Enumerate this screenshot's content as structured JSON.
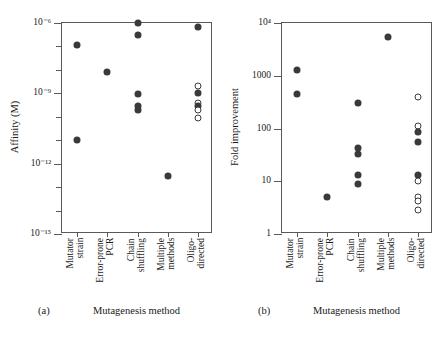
{
  "figure": {
    "panels": [
      {
        "tag": "(a)",
        "xlabel": "Mutagenesis method",
        "ylabel": "Affinity (M)"
      },
      {
        "tag": "(b)",
        "xlabel": "Mutagenesis method",
        "ylabel": "Fold improvement"
      }
    ]
  },
  "categories": [
    "Mutator\nstrain",
    "Error-prone\nPCR",
    "Chain\nshuffling",
    "Multiple\nmethods",
    "Oligo-\ndirected"
  ],
  "yticks_a": [
    {
      "label": "10⁻⁶",
      "exp": -6,
      "major": true
    },
    {
      "label": "",
      "exp": -7,
      "major": false
    },
    {
      "label": "",
      "exp": -8,
      "major": false
    },
    {
      "label": "10⁻⁹",
      "exp": -9,
      "major": true
    },
    {
      "label": "",
      "exp": -10,
      "major": false
    },
    {
      "label": "",
      "exp": -11,
      "major": false
    },
    {
      "label": "10⁻¹²",
      "exp": -12,
      "major": true
    },
    {
      "label": "",
      "exp": -13,
      "major": false
    },
    {
      "label": "",
      "exp": -14,
      "major": false
    },
    {
      "label": "10⁻¹⁵",
      "exp": -15,
      "major": true
    }
  ],
  "yticks_b": [
    {
      "label": "10⁴",
      "exp": 4,
      "major": true
    },
    {
      "label": "1000",
      "exp": 3,
      "major": true
    },
    {
      "label": "100",
      "exp": 2,
      "major": true
    },
    {
      "label": "10",
      "exp": 1,
      "major": true
    },
    {
      "label": "1",
      "exp": 0,
      "major": true
    }
  ],
  "chart_data": [
    {
      "type": "scatter",
      "title": "(a)",
      "xlabel": "Mutagenesis method",
      "ylabel": "Affinity (M)",
      "yscale": "log",
      "ylim": [
        1e-15,
        1e-06
      ],
      "ytick_labels": [
        "10^-6",
        "10^-9",
        "10^-12",
        "10^-15"
      ],
      "ytick_values": [
        1e-06,
        1e-09,
        1e-12,
        1e-15
      ],
      "minor_ticks": true,
      "grid": false,
      "legend": null,
      "categories": [
        "Mutator strain",
        "Error-prone PCR",
        "Chain shuffling",
        "Multiple methods",
        "Oligo-directed"
      ],
      "series": [
        {
          "name": "Reported affinity",
          "points": [
            {
              "category": "Mutator strain",
              "value": 1.2e-07,
              "marker": "filled"
            },
            {
              "category": "Mutator strain",
              "value": 1e-11,
              "marker": "filled"
            },
            {
              "category": "Error-prone PCR",
              "value": 8e-09,
              "marker": "filled"
            },
            {
              "category": "Chain shuffling",
              "value": 1e-06,
              "marker": "filled"
            },
            {
              "category": "Chain shuffling",
              "value": 3e-07,
              "marker": "filled"
            },
            {
              "category": "Chain shuffling",
              "value": 9e-10,
              "marker": "filled"
            },
            {
              "category": "Chain shuffling",
              "value": 3e-10,
              "marker": "filled"
            },
            {
              "category": "Chain shuffling",
              "value": 2e-10,
              "marker": "filled"
            },
            {
              "category": "Multiple methods",
              "value": 3e-13,
              "marker": "filled"
            },
            {
              "category": "Oligo-directed",
              "value": 7e-07,
              "marker": "filled"
            },
            {
              "category": "Oligo-directed",
              "value": 2e-09,
              "marker": "open"
            },
            {
              "category": "Oligo-directed",
              "value": 1e-09,
              "marker": "filled"
            },
            {
              "category": "Oligo-directed",
              "value": 4e-10,
              "marker": "open"
            },
            {
              "category": "Oligo-directed",
              "value": 3e-10,
              "marker": "filled"
            },
            {
              "category": "Oligo-directed",
              "value": 2e-10,
              "marker": "open"
            },
            {
              "category": "Oligo-directed",
              "value": 9e-11,
              "marker": "open"
            }
          ]
        }
      ]
    },
    {
      "type": "scatter",
      "title": "(b)",
      "xlabel": "Mutagenesis method",
      "ylabel": "Fold improvement",
      "yscale": "log",
      "ylim": [
        1,
        10000
      ],
      "ytick_labels": [
        "10^4",
        "1000",
        "100",
        "10",
        "1"
      ],
      "ytick_values": [
        10000,
        1000,
        100,
        10,
        1
      ],
      "minor_ticks": false,
      "grid": false,
      "legend": null,
      "categories": [
        "Mutator strain",
        "Error-prone PCR",
        "Chain shuffling",
        "Multiple methods",
        "Oligo-directed"
      ],
      "series": [
        {
          "name": "Reported fold improvement",
          "points": [
            {
              "category": "Mutator strain",
              "value": 1300,
              "marker": "filled"
            },
            {
              "category": "Mutator strain",
              "value": 450,
              "marker": "filled"
            },
            {
              "category": "Error-prone PCR",
              "value": 5,
              "marker": "filled"
            },
            {
              "category": "Chain shuffling",
              "value": 300,
              "marker": "filled"
            },
            {
              "category": "Chain shuffling",
              "value": 42,
              "marker": "filled"
            },
            {
              "category": "Chain shuffling",
              "value": 33,
              "marker": "filled"
            },
            {
              "category": "Chain shuffling",
              "value": 13,
              "marker": "filled"
            },
            {
              "category": "Chain shuffling",
              "value": 9,
              "marker": "filled"
            },
            {
              "category": "Multiple methods",
              "value": 5500,
              "marker": "filled"
            },
            {
              "category": "Oligo-directed",
              "value": 400,
              "marker": "open"
            },
            {
              "category": "Oligo-directed",
              "value": 110,
              "marker": "open"
            },
            {
              "category": "Oligo-directed",
              "value": 85,
              "marker": "filled"
            },
            {
              "category": "Oligo-directed",
              "value": 55,
              "marker": "filled"
            },
            {
              "category": "Oligo-directed",
              "value": 13,
              "marker": "filled"
            },
            {
              "category": "Oligo-directed",
              "value": 10,
              "marker": "open"
            },
            {
              "category": "Oligo-directed",
              "value": 5,
              "marker": "open"
            },
            {
              "category": "Oligo-directed",
              "value": 4.2,
              "marker": "open"
            },
            {
              "category": "Oligo-directed",
              "value": 2.8,
              "marker": "open"
            }
          ]
        }
      ]
    }
  ],
  "colors": {
    "marker_fill": "#3a3a3a",
    "marker_stroke": "#3a3a3a",
    "axis": "#5a5a5a",
    "text": "#1a1a1a",
    "background": "#ffffff"
  }
}
